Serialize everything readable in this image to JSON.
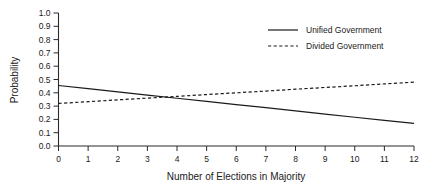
{
  "chart_data": {
    "type": "line",
    "title": "",
    "xlabel": "Number of Elections in Majority",
    "ylabel": "Probability",
    "xlim": [
      0,
      12
    ],
    "ylim": [
      0.0,
      1.0
    ],
    "grid": false,
    "legend_position": "top-right",
    "x": [
      0,
      1,
      2,
      3,
      4,
      5,
      6,
      7,
      8,
      9,
      10,
      11,
      12
    ],
    "xticklabels": [
      "0",
      "1",
      "2",
      "3",
      "4",
      "5",
      "6",
      "7",
      "8",
      "9",
      "10",
      "11",
      "12"
    ],
    "yticklabels": [
      "0.0",
      "0.1",
      "0.2",
      "0.3",
      "0.4",
      "0.5",
      "0.6",
      "0.7",
      "0.8",
      "0.9",
      "1.0"
    ],
    "yticks": [
      0.0,
      0.1,
      0.2,
      0.3,
      0.4,
      0.5,
      0.6,
      0.7,
      0.8,
      0.9,
      1.0
    ],
    "series": [
      {
        "name": "Unified Government",
        "style": "solid",
        "color": "#1a1a1a",
        "values": [
          0.455,
          0.431,
          0.407,
          0.383,
          0.359,
          0.335,
          0.311,
          0.288,
          0.264,
          0.24,
          0.216,
          0.193,
          0.17
        ]
      },
      {
        "name": "Divided Government",
        "style": "dashed",
        "color": "#1a1a1a",
        "values": [
          0.32,
          0.333,
          0.347,
          0.36,
          0.373,
          0.387,
          0.4,
          0.413,
          0.427,
          0.44,
          0.453,
          0.467,
          0.48
        ]
      }
    ],
    "annotations": []
  },
  "legend": {
    "items": [
      {
        "label": "Unified Government",
        "style": "solid"
      },
      {
        "label": "Divided Government",
        "style": "dashed"
      }
    ]
  }
}
